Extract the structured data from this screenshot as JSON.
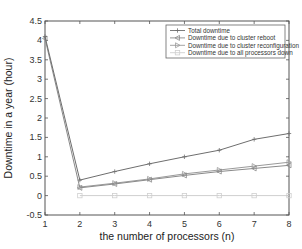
{
  "chart_data": {
    "type": "line",
    "title": "",
    "xlabel": "the number of processors (n)",
    "ylabel": "Downtime in a year (hour)",
    "xlim": [
      1,
      8
    ],
    "ylim": [
      -0.5,
      4.5
    ],
    "x": [
      1,
      2,
      3,
      4,
      5,
      6,
      7,
      8
    ],
    "xticks": [
      "1",
      "2",
      "3",
      "4",
      "5",
      "6",
      "7",
      "8"
    ],
    "yticks": [
      "-0.5",
      "0",
      "0.5",
      "1",
      "1.5",
      "2",
      "2.5",
      "3",
      "3.5",
      "4",
      "4.5"
    ],
    "grid": false,
    "legend_position": "upper right",
    "series": [
      {
        "name": "Total downtime",
        "marker": "+",
        "color": "#6e6e6e",
        "values": [
          4.1,
          0.4,
          0.62,
          0.82,
          1.0,
          1.17,
          1.45,
          1.6
        ]
      },
      {
        "name": "Downtime due to cluster reboot",
        "marker": "<",
        "color": "#8a8a8a",
        "values": [
          4.05,
          0.2,
          0.3,
          0.41,
          0.52,
          0.62,
          0.7,
          0.78
        ]
      },
      {
        "name": "Downtime due to cluster reconfiguration",
        "marker": ">",
        "color": "#9a9a9a",
        "values": [
          null,
          0.22,
          0.32,
          0.43,
          0.56,
          0.66,
          0.76,
          0.86
        ]
      },
      {
        "name": "Downtime due to all processors down",
        "marker": "square",
        "color": "#cfcfcf",
        "values": [
          null,
          0.0,
          0.0,
          0.0,
          0.0,
          0.0,
          0.0,
          0.0
        ]
      }
    ]
  }
}
